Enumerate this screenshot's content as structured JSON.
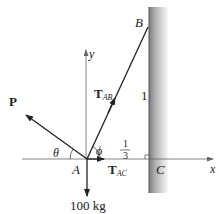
{
  "diagram": {
    "type": "free-body diagram",
    "points": {
      "A": {
        "label": "A"
      },
      "B": {
        "label": "B"
      },
      "C": {
        "label": "C"
      }
    },
    "axes": {
      "x_label": "x",
      "y_label": "y"
    },
    "forces": {
      "P": {
        "label": "P"
      },
      "T_AB": {
        "main": "T",
        "sub": "AB"
      },
      "T_AC": {
        "main": "T",
        "sub": "AC"
      },
      "weight": {
        "label": "100 kg"
      }
    },
    "angles": {
      "theta": "θ",
      "phi": "ϕ"
    },
    "slope": {
      "rise": "1",
      "run_num": "1",
      "run_den": "3"
    },
    "colors": {
      "line": "#222222",
      "axis": "#777777",
      "wall_dark": "#8a8a8a",
      "wall_light": "#ffffff"
    }
  }
}
